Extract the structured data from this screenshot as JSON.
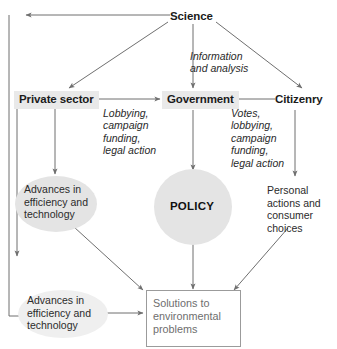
{
  "diagram": {
    "palette": {
      "plate_gray": "#e9e9e9",
      "blob_gray": "#e4e4e4",
      "blob_gray_faint": "#efefef",
      "line_gray": "#6f6f6f",
      "outcome_border": "#9b9b9b",
      "outcome_text": "#6e6e6e",
      "text_black": "#1b1b1b"
    },
    "nodes": {
      "science": {
        "label": "Science",
        "type": "actor-label"
      },
      "private_sector": {
        "label": "Private sector",
        "type": "actor-label"
      },
      "government": {
        "label": "Government",
        "type": "actor-label"
      },
      "citizenry": {
        "label": "Citizenry",
        "type": "actor-label"
      },
      "advances_upper": {
        "label": "Advances in\nefficiency and\ntechnology",
        "type": "ellipse"
      },
      "policy": {
        "label": "POLICY",
        "type": "ellipse"
      },
      "personal_actions": {
        "label": "Personal\nactions and\nconsumer\nchoices",
        "type": "text"
      },
      "advances_lower": {
        "label": "Advances in\nefficiency and\ntechnology",
        "type": "ellipse-faint"
      },
      "solutions": {
        "label": "Solutions to\nenvironmental\nproblems",
        "type": "box"
      }
    },
    "edge_labels": {
      "science_to_government": "Information\nand analysis",
      "private_to_government": "Lobbying,\ncampaign\nfunding,\nlegal action",
      "citizenry_to_government": "Votes,\nlobbying,\ncampaign\nfunding,\nlegal action"
    },
    "edges": [
      {
        "from": "science",
        "to": "private_sector",
        "kind": "arrow"
      },
      {
        "from": "science",
        "to": "government",
        "kind": "arrow",
        "label": "Information and analysis"
      },
      {
        "from": "science",
        "to": "citizenry",
        "kind": "arrow"
      },
      {
        "from": "science",
        "to": "feedback_left",
        "kind": "arrow"
      },
      {
        "from": "private_sector",
        "to": "government",
        "kind": "arrow",
        "label": "Lobbying, campaign funding, legal action"
      },
      {
        "from": "citizenry",
        "to": "government",
        "kind": "arrow",
        "label": "Votes, lobbying, campaign funding, legal action"
      },
      {
        "from": "private_sector",
        "to": "advances_upper",
        "kind": "arrow"
      },
      {
        "from": "government",
        "to": "policy",
        "kind": "arrow"
      },
      {
        "from": "citizenry",
        "to": "personal_actions",
        "kind": "arrow"
      },
      {
        "from": "advances_upper",
        "to": "solutions",
        "kind": "arrow"
      },
      {
        "from": "policy",
        "to": "solutions",
        "kind": "arrow"
      },
      {
        "from": "personal_actions",
        "to": "solutions",
        "kind": "arrow"
      },
      {
        "from": "advances_lower",
        "to": "solutions",
        "kind": "arrow"
      },
      {
        "from": "advances_upper",
        "to": "advances_lower",
        "kind": "arrow"
      },
      {
        "from": "advances_lower_loop",
        "to": "science",
        "kind": "arrow"
      }
    ]
  }
}
